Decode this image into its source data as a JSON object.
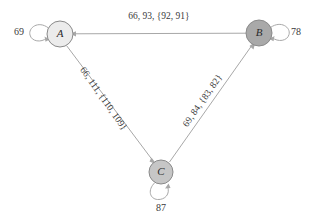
{
  "diagram": {
    "type": "directed-graph-triangle",
    "background_color": "#ffffff",
    "edge_color": "#a8a8a8",
    "text_color": "#3a3a3a",
    "nodes": [
      {
        "id": "A",
        "label": "A",
        "cx": 60,
        "cy": 34,
        "r": 13,
        "fill": "#ececec",
        "stroke": "#8a8a8a",
        "self_loop_label": "69",
        "self_loop_side": "left"
      },
      {
        "id": "B",
        "label": "B",
        "cx": 259,
        "cy": 33,
        "r": 13,
        "fill": "#a9a9a9",
        "stroke": "#8a8a8a",
        "self_loop_label": "78",
        "self_loop_side": "right"
      },
      {
        "id": "C",
        "label": "C",
        "cx": 161,
        "cy": 172,
        "r": 12,
        "fill": "#c6c6c6",
        "stroke": "#8a8a8a",
        "self_loop_label": "87",
        "self_loop_side": "bottom"
      }
    ],
    "edges": [
      {
        "id": "edge-a-b",
        "from": "A",
        "to": "B",
        "label": "66, 93, {92, 91}",
        "label_x": 159,
        "label_y": 17,
        "label_rotation": 0
      },
      {
        "id": "edge-a-c",
        "from": "A",
        "to": "C",
        "label": "66, 111, {110, 109}",
        "label_x": 103,
        "label_y": 99,
        "label_rotation": 55
      },
      {
        "id": "edge-b-c",
        "from": "B",
        "to": "C",
        "label": "69, 84, {83, 82}",
        "label_x": 203,
        "label_y": 101,
        "label_rotation": -55
      }
    ],
    "self_loops": [
      {
        "id": "loop-a",
        "node": "A",
        "label": "69",
        "label_x": 19,
        "label_y": 33
      },
      {
        "id": "loop-b",
        "node": "B",
        "label": "78",
        "label_x": 296,
        "label_y": 33
      },
      {
        "id": "loop-c",
        "node": "C",
        "label": "87",
        "label_x": 161,
        "label_y": 209
      }
    ]
  }
}
